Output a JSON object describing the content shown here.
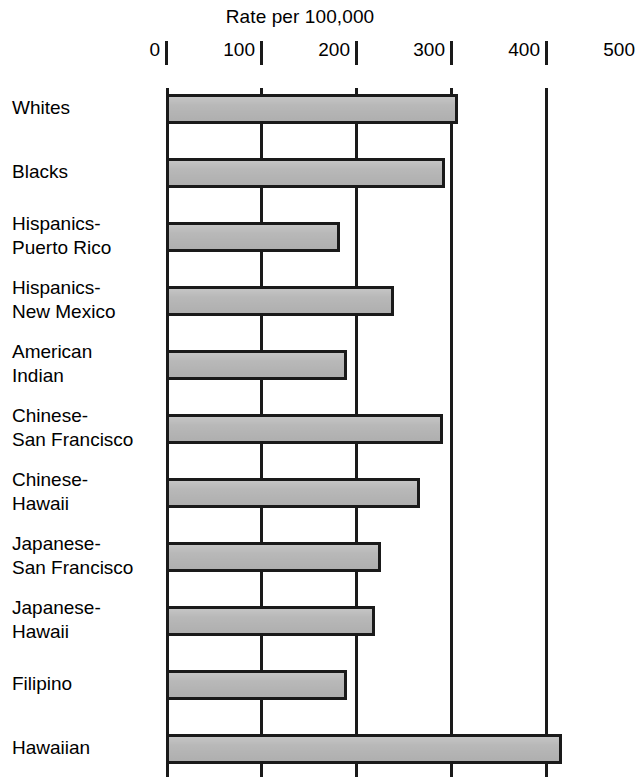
{
  "chart_data": {
    "type": "bar",
    "orientation": "horizontal",
    "title": "Rate per 100,000",
    "xlabel": "Rate per 100,000",
    "ylabel": "",
    "xlim": [
      0,
      500
    ],
    "xticks": [
      0,
      100,
      200,
      300,
      400,
      500
    ],
    "xtick_labels": [
      "0",
      "100",
      "200",
      "300",
      "400",
      "500"
    ],
    "gridlines_at": [
      0,
      100,
      200,
      300,
      400
    ],
    "grid": true,
    "legend": "none",
    "categories": [
      "Whites",
      "Blacks",
      "Hispanics-\nPuerto Rico",
      "Hispanics-\nNew Mexico",
      "American\nIndian",
      "Chinese-\nSan Francisco",
      "Chinese-\nHawaii",
      "Japanese-\nSan Francisco",
      "Japanese-\nHawaii",
      "Filipino",
      "Hawaiian"
    ],
    "values": [
      305,
      292,
      181,
      238,
      188,
      289,
      265,
      224,
      218,
      188,
      415
    ],
    "bar_fill_color": "#b8b8b8",
    "bar_edge_color": "#1a1a1a",
    "background_color": "#ffffff",
    "note": "Last bar (Hawaiian) is clipped by the bottom edge of the image"
  },
  "axis": {
    "ticks": [
      {
        "label": "0",
        "value": 0
      },
      {
        "label": "100",
        "value": 100
      },
      {
        "label": "200",
        "value": 200
      },
      {
        "label": "300",
        "value": 300
      },
      {
        "label": "400",
        "value": 400
      },
      {
        "label": "500",
        "value": 500
      }
    ]
  },
  "title": "Rate per 100,000",
  "rows": [
    {
      "label": "Whites",
      "value": 305
    },
    {
      "label": "Blacks",
      "value": 292
    },
    {
      "label": "Hispanics-\nPuerto Rico",
      "value": 181
    },
    {
      "label": "Hispanics-\nNew Mexico",
      "value": 238
    },
    {
      "label": "American\nIndian",
      "value": 188
    },
    {
      "label": "Chinese-\nSan Francisco",
      "value": 289
    },
    {
      "label": "Chinese-\nHawaii",
      "value": 265
    },
    {
      "label": "Japanese-\nSan Francisco",
      "value": 224
    },
    {
      "label": "Japanese-\nHawaii",
      "value": 218
    },
    {
      "label": "Filipino",
      "value": 188
    },
    {
      "label": "Hawaiian",
      "value": 415
    }
  ]
}
